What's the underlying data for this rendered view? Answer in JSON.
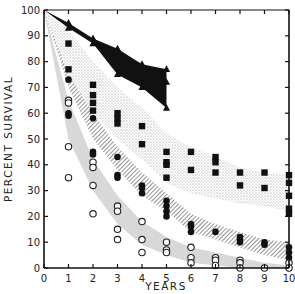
{
  "chart_data": {
    "type": "scatter",
    "title": "",
    "xlabel": "YEARS",
    "ylabel": "PERCENT SURVIVAL",
    "xlim": [
      0,
      10
    ],
    "ylim": [
      0,
      100
    ],
    "x_ticks": [
      0,
      1,
      2,
      3,
      4,
      5,
      6,
      7,
      8,
      9,
      10
    ],
    "y_ticks": [
      0,
      10,
      20,
      30,
      40,
      50,
      60,
      70,
      80,
      90,
      100
    ],
    "grid": false,
    "legend": null,
    "series": [
      {
        "name": "triangle-band",
        "marker": "filled-triangle",
        "band_fill": "solid-black",
        "band_upper": [
          [
            0,
            100
          ],
          [
            1,
            95
          ],
          [
            2,
            89
          ],
          [
            3,
            85
          ],
          [
            4,
            79
          ],
          [
            5,
            77
          ]
        ],
        "band_lower": [
          [
            0,
            100
          ],
          [
            1,
            93
          ],
          [
            2,
            87
          ],
          [
            3,
            75
          ],
          [
            4,
            70
          ],
          [
            5,
            62
          ]
        ],
        "points": [
          [
            1,
            95
          ],
          [
            1,
            93
          ],
          [
            2,
            89
          ],
          [
            2,
            87
          ],
          [
            3,
            85
          ],
          [
            3,
            82
          ],
          [
            3,
            75
          ],
          [
            4,
            79
          ],
          [
            4,
            70
          ],
          [
            5,
            77
          ],
          [
            5,
            72
          ],
          [
            5,
            62
          ]
        ]
      },
      {
        "name": "filled-square-band",
        "marker": "filled-square",
        "band_fill": "dotted",
        "band_upper": [
          [
            0,
            100
          ],
          [
            1,
            92
          ],
          [
            2,
            80
          ],
          [
            3,
            70
          ],
          [
            4,
            62
          ],
          [
            5,
            52
          ],
          [
            6,
            47
          ],
          [
            7,
            43
          ],
          [
            8,
            39
          ],
          [
            9,
            37
          ],
          [
            10,
            36
          ]
        ],
        "band_lower": [
          [
            0,
            100
          ],
          [
            1,
            75
          ],
          [
            2,
            60
          ],
          [
            3,
            50
          ],
          [
            4,
            42
          ],
          [
            5,
            33
          ],
          [
            6,
            29
          ],
          [
            7,
            27
          ],
          [
            8,
            25
          ],
          [
            9,
            24
          ],
          [
            10,
            22
          ]
        ],
        "points": [
          [
            1,
            87
          ],
          [
            1,
            77
          ],
          [
            2,
            71
          ],
          [
            2,
            67
          ],
          [
            2,
            64
          ],
          [
            2,
            61
          ],
          [
            3,
            60
          ],
          [
            3,
            58
          ],
          [
            3,
            56
          ],
          [
            4,
            55
          ],
          [
            4,
            48
          ],
          [
            5,
            45
          ],
          [
            5,
            41
          ],
          [
            5,
            40
          ],
          [
            5,
            35
          ],
          [
            6,
            45
          ],
          [
            6,
            38
          ],
          [
            7,
            43
          ],
          [
            7,
            41
          ],
          [
            7,
            37
          ],
          [
            8,
            37
          ],
          [
            8,
            32
          ],
          [
            9,
            37
          ],
          [
            9,
            31
          ],
          [
            10,
            36
          ],
          [
            10,
            33
          ],
          [
            10,
            28
          ],
          [
            10,
            23
          ],
          [
            10,
            21
          ]
        ]
      },
      {
        "name": "filled-circle-band",
        "marker": "filled-circle",
        "band_fill": "diagonal-hatch",
        "band_upper": [
          [
            0,
            100
          ],
          [
            1,
            78
          ],
          [
            2,
            60
          ],
          [
            3,
            47
          ],
          [
            4,
            37
          ],
          [
            5,
            29
          ],
          [
            6,
            21
          ],
          [
            7,
            17
          ],
          [
            8,
            14
          ],
          [
            9,
            11
          ],
          [
            10,
            10
          ]
        ],
        "band_lower": [
          [
            0,
            100
          ],
          [
            1,
            70
          ],
          [
            2,
            50
          ],
          [
            3,
            38
          ],
          [
            4,
            28
          ],
          [
            5,
            22
          ],
          [
            6,
            14
          ],
          [
            7,
            11
          ],
          [
            8,
            8
          ],
          [
            9,
            5
          ],
          [
            10,
            3
          ]
        ],
        "points": [
          [
            1,
            73
          ],
          [
            1,
            60
          ],
          [
            1,
            59
          ],
          [
            2,
            58
          ],
          [
            2,
            45
          ],
          [
            2,
            44
          ],
          [
            3,
            43
          ],
          [
            3,
            36
          ],
          [
            3,
            35
          ],
          [
            4,
            32
          ],
          [
            4,
            31
          ],
          [
            4,
            29
          ],
          [
            5,
            26
          ],
          [
            5,
            24
          ],
          [
            5,
            22
          ],
          [
            5,
            20
          ],
          [
            6,
            17
          ],
          [
            6,
            16
          ],
          [
            6,
            14
          ],
          [
            7,
            14
          ],
          [
            8,
            12
          ],
          [
            8,
            11
          ],
          [
            8,
            10
          ],
          [
            9,
            10
          ],
          [
            9,
            9
          ],
          [
            10,
            8
          ],
          [
            10,
            6
          ],
          [
            10,
            4
          ],
          [
            10,
            0
          ]
        ]
      },
      {
        "name": "open-circle-band",
        "marker": "open-circle",
        "band_fill": "light-gray",
        "band_upper": [
          [
            0,
            100
          ],
          [
            1,
            65
          ],
          [
            2,
            42
          ],
          [
            3,
            28
          ],
          [
            4,
            18
          ],
          [
            5,
            12
          ],
          [
            6,
            8
          ],
          [
            7,
            6
          ],
          [
            8,
            4
          ],
          [
            9,
            2
          ],
          [
            10,
            1
          ]
        ],
        "band_lower": [
          [
            0,
            100
          ],
          [
            1,
            50
          ],
          [
            2,
            30
          ],
          [
            3,
            17
          ],
          [
            4,
            9
          ],
          [
            5,
            5
          ],
          [
            6,
            2
          ],
          [
            7,
            1
          ],
          [
            8,
            0
          ],
          [
            9,
            0
          ],
          [
            10,
            0
          ]
        ],
        "points": [
          [
            1,
            65
          ],
          [
            1,
            64
          ],
          [
            1,
            47
          ],
          [
            1,
            35
          ],
          [
            2,
            41
          ],
          [
            2,
            39
          ],
          [
            2,
            32
          ],
          [
            2,
            21
          ],
          [
            3,
            24
          ],
          [
            3,
            22
          ],
          [
            3,
            15
          ],
          [
            3,
            11
          ],
          [
            4,
            18
          ],
          [
            4,
            11
          ],
          [
            4,
            6
          ],
          [
            5,
            10
          ],
          [
            5,
            7
          ],
          [
            5,
            6
          ],
          [
            6,
            8
          ],
          [
            6,
            4
          ],
          [
            6,
            2
          ],
          [
            7,
            4
          ],
          [
            7,
            3
          ],
          [
            7,
            1
          ],
          [
            8,
            3
          ],
          [
            8,
            2
          ],
          [
            8,
            0
          ],
          [
            9,
            0
          ],
          [
            10,
            2
          ],
          [
            10,
            0
          ]
        ]
      }
    ]
  },
  "axes": {
    "x_title": "YEARS",
    "y_title": "PERCENT SURVIVAL"
  },
  "colors": {
    "ink": "#111111",
    "dotted_band": "#cfcfcf",
    "hatch_band": "#6a6a6a",
    "gray_band": "#d6d6d6"
  }
}
